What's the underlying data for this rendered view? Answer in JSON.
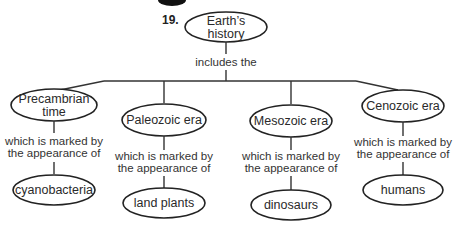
{
  "question_number": "19.",
  "root": {
    "label_lines": [
      "Earth’s",
      "history"
    ]
  },
  "root_link": "includes the",
  "branches": [
    {
      "era_lines": [
        "Precambrian",
        "time"
      ],
      "link_lines": [
        "which is marked by",
        "the appearance of"
      ],
      "marker": "cyanobacteria"
    },
    {
      "era_lines": [
        "Paleozoic era"
      ],
      "link_lines": [
        "which is marked by",
        "the appearance of"
      ],
      "marker": "land plants"
    },
    {
      "era_lines": [
        "Mesozoic era"
      ],
      "link_lines": [
        "which is marked by",
        "the appearance of"
      ],
      "marker": "dinosaurs"
    },
    {
      "era_lines": [
        "Cenozoic era"
      ],
      "link_lines": [
        "which is marked by",
        "the appearance of"
      ],
      "marker": "humans"
    }
  ]
}
